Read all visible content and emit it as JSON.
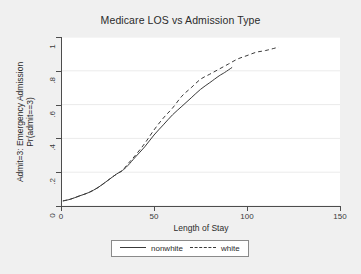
{
  "chart_data": {
    "type": "line",
    "title": "Medicare LOS vs Admission Type",
    "xlabel": "Length of Stay",
    "ylabel_line1": "Admit=3: Emergency Admission",
    "ylabel_line2": "Pr(admit==3)",
    "xlim": [
      0,
      150
    ],
    "ylim": [
      0,
      1
    ],
    "xticks": [
      "0",
      "50",
      "100",
      "150"
    ],
    "xtick_values": [
      0,
      50,
      100,
      150
    ],
    "yticks": [
      "0",
      ".2",
      ".4",
      ".6",
      ".8",
      "1"
    ],
    "ytick_values": [
      0,
      0.2,
      0.4,
      0.6,
      0.8,
      1
    ],
    "grid": "horizontal",
    "legend_position": "bottom-center",
    "series": [
      {
        "name": "nonwhite",
        "style": "solid",
        "color": "#3a3a3a",
        "x": [
          1,
          5,
          10,
          15,
          20,
          25,
          30,
          33,
          36,
          40,
          45,
          50,
          55,
          60,
          65,
          70,
          75,
          80,
          85,
          88,
          92
        ],
        "values": [
          0.03,
          0.04,
          0.06,
          0.08,
          0.11,
          0.15,
          0.19,
          0.21,
          0.24,
          0.29,
          0.35,
          0.42,
          0.48,
          0.54,
          0.59,
          0.64,
          0.69,
          0.73,
          0.77,
          0.79,
          0.82
        ]
      },
      {
        "name": "white",
        "style": "dashed",
        "color": "#3a3a3a",
        "x": [
          1,
          5,
          10,
          15,
          20,
          25,
          30,
          33,
          36,
          40,
          45,
          50,
          55,
          60,
          65,
          70,
          75,
          80,
          85,
          90,
          95,
          100,
          105,
          110,
          117
        ],
        "values": [
          0.03,
          0.04,
          0.06,
          0.08,
          0.11,
          0.15,
          0.19,
          0.21,
          0.25,
          0.3,
          0.37,
          0.45,
          0.52,
          0.58,
          0.65,
          0.7,
          0.75,
          0.78,
          0.81,
          0.84,
          0.87,
          0.89,
          0.91,
          0.92,
          0.94
        ]
      }
    ]
  },
  "legend": {
    "entries": [
      {
        "label": "nonwhite",
        "style": "solid"
      },
      {
        "label": "white",
        "style": "dashed"
      }
    ]
  },
  "colors": {
    "page_background": "#f0f0f0",
    "panel_background": "#ffffff",
    "axis": "#4d4d4d",
    "gridline": "#ebebeb",
    "text": "#2b2b2b",
    "line": "#3a3a3a"
  }
}
